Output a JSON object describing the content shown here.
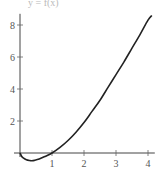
{
  "chart_data": {
    "type": "line",
    "title": "y = f(x)",
    "xlabel": "",
    "ylabel": "",
    "xlim": [
      0,
      4.15
    ],
    "ylim": [
      -0.6,
      8.7
    ],
    "grid": false,
    "legend": null,
    "x_ticks": [
      1,
      2,
      3,
      4
    ],
    "x_tick_labels": [
      "1",
      "2",
      "3",
      "4"
    ],
    "y_ticks": [
      2,
      4,
      6,
      8
    ],
    "y_tick_labels": [
      "2",
      "4",
      "6",
      "8"
    ],
    "series": [
      {
        "name": "f(x)",
        "color": "#222222",
        "x": [
          0,
          0.05,
          0.1,
          0.2,
          0.3,
          0.37,
          0.45,
          0.6,
          0.8,
          1.0,
          1.25,
          1.5,
          1.75,
          2.0,
          2.25,
          2.5,
          2.75,
          3.0,
          3.25,
          3.5,
          3.75,
          4.0,
          4.12
        ],
        "y": [
          0,
          -0.2,
          -0.3,
          -0.42,
          -0.47,
          -0.48,
          -0.46,
          -0.38,
          -0.2,
          0,
          0.35,
          0.78,
          1.3,
          1.9,
          2.6,
          3.3,
          4.1,
          4.9,
          5.7,
          6.55,
          7.4,
          8.3,
          8.6
        ]
      }
    ]
  },
  "plot": {
    "origin_px": [
      20,
      153
    ],
    "x_px_per_unit": 32,
    "y_px_per_unit": 16
  }
}
